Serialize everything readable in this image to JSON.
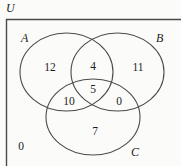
{
  "figure": {
    "type": "venn-diagram",
    "sets": 3,
    "universe_label": "U",
    "background_color": "#fbfbfa",
    "stroke_color": "#3a3a3a",
    "text_color": "#1d1d1d"
  },
  "labels": {
    "universe": "U",
    "set_a": "A",
    "set_b": "B",
    "set_c": "C"
  },
  "regions": [
    {
      "key": "a_only",
      "label": "12",
      "x": 50,
      "y": 68
    },
    {
      "key": "a_and_b",
      "label": "4",
      "x": 93,
      "y": 67
    },
    {
      "key": "b_only",
      "label": "11",
      "x": 138,
      "y": 68
    },
    {
      "key": "a_b_c",
      "label": "5",
      "x": 93,
      "y": 90
    },
    {
      "key": "a_and_c",
      "label": "10",
      "x": 69,
      "y": 102
    },
    {
      "key": "b_and_c",
      "label": "0",
      "x": 119,
      "y": 102
    },
    {
      "key": "c_only",
      "label": "7",
      "x": 95,
      "y": 132
    },
    {
      "key": "outside",
      "label": "0",
      "x": 21,
      "y": 147
    }
  ],
  "chart_data": {
    "type": "table",
    "categories": [
      "A only",
      "A and B only",
      "B only",
      "A and B and C",
      "A and C only",
      "B and C only",
      "C only",
      "Outside all sets"
    ],
    "values": [
      12,
      4,
      11,
      5,
      10,
      0,
      7,
      0
    ],
    "xlabel": "Region",
    "ylabel": "Count",
    "legend": [
      "A",
      "B",
      "C",
      "U"
    ]
  }
}
